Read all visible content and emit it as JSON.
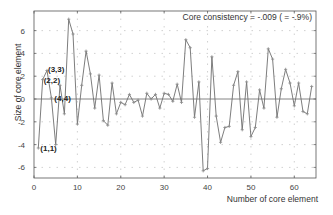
{
  "chart_data": {
    "type": "line",
    "title": "",
    "xlabel": "Number of core element",
    "ylabel": "Size of core element",
    "xlim": [
      0,
      65
    ],
    "ylim": [
      -6.93,
      7.72
    ],
    "xticks": [
      0,
      10,
      20,
      30,
      40,
      50,
      60
    ],
    "yticks": [
      -6,
      -4,
      -2,
      0,
      2,
      4,
      6
    ],
    "grid": true,
    "zero_line": true,
    "marker": "plus",
    "annotation": "Core consistency = -.009 ( =   -.9%)",
    "point_labels": [
      {
        "index": 1,
        "text": "(1,1)"
      },
      {
        "index": 2,
        "text": "(2,2)"
      },
      {
        "index": 3,
        "text": "(3,3)"
      },
      {
        "index": 4,
        "text": "(4,4)"
      }
    ],
    "series": [
      {
        "name": "Core elements",
        "x": [
          1,
          2,
          3,
          4,
          5,
          6,
          7,
          8,
          9,
          10,
          11,
          12,
          13,
          14,
          15,
          16,
          17,
          18,
          19,
          20,
          21,
          22,
          23,
          24,
          25,
          26,
          27,
          28,
          29,
          30,
          31,
          32,
          33,
          34,
          35,
          36,
          37,
          38,
          39,
          40,
          41,
          42,
          43,
          44,
          45,
          46,
          47,
          48,
          49,
          50,
          51,
          52,
          53,
          54,
          55,
          56,
          57,
          58,
          59,
          60,
          61,
          62,
          63,
          64
        ],
        "values": [
          -4.3,
          1.7,
          2.5,
          0.1,
          -4.0,
          1.2,
          -1.3,
          7.0,
          5.7,
          -2.2,
          1.2,
          4.2,
          2.2,
          -0.8,
          2.1,
          -1.9,
          -2.3,
          1.4,
          -1.3,
          -0.3,
          -0.5,
          0.4,
          -0.3,
          -0.1,
          -1.5,
          0.5,
          0.0,
          0.4,
          -0.8,
          0.5,
          0.4,
          -0.2,
          1.3,
          -0.3,
          5.2,
          4.5,
          -1.6,
          1.5,
          -6.3,
          -6.1,
          3.7,
          -1.5,
          -3.8,
          -2.5,
          -2.4,
          1.2,
          2.4,
          -2.7,
          1.5,
          -3.3,
          -2.5,
          0.8,
          -0.8,
          4.4,
          3.5,
          -1.6,
          0.9,
          2.6,
          1.4,
          -0.6,
          1.4,
          -1.1,
          -1.3,
          1.1
        ]
      }
    ]
  },
  "colors": {
    "line": "#6e6e6e",
    "axis": "#555555",
    "grid": "#bdbdbd",
    "zero_line": "#777777"
  }
}
